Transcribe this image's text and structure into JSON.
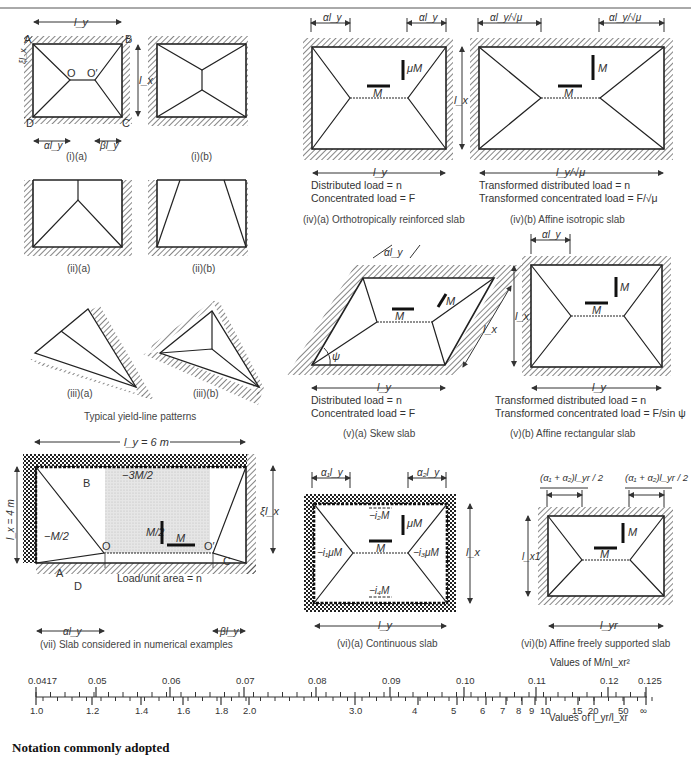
{
  "figure": {
    "panels": {
      "i_a": {
        "caption": "(i)(a)",
        "labels": {
          "ly": "l_y",
          "lx": "l_x",
          "xi_lx": "ξl_x",
          "alpha_ly": "αl_y",
          "beta_ly": "βl_y",
          "A": "A",
          "B": "B",
          "C": "C",
          "D": "D",
          "O": "O",
          "O_prime": "O′"
        }
      },
      "i_b": {
        "caption": "(i)(b)"
      },
      "ii_a": {
        "caption": "(ii)(a)"
      },
      "ii_b": {
        "caption": "(ii)(b)"
      },
      "iii_a": {
        "caption": "(iii)(a)"
      },
      "iii_b": {
        "caption": "(iii)(b)"
      },
      "group_caption": "Typical yield-line patterns",
      "iv_a": {
        "caption": "(iv)(a) Orthotropically reinforced slab",
        "dim_top": "αl_y",
        "dim_bottom": "l_y",
        "dim_side": "l_x",
        "moment_v": "μM",
        "moment_h": "M",
        "load1": "Distributed load = n",
        "load2": "Concentrated load = F"
      },
      "iv_b": {
        "caption": "(iv)(b) Affine isotropic slab",
        "dim_top": "αl_y/√μ",
        "dim_bottom": "l_y/√μ",
        "moment_v": "M",
        "moment_h": "M",
        "load1": "Transformed distributed load = n",
        "load2": "Transformed concentrated load = F/√μ"
      },
      "v_a": {
        "caption": "(v)(a) Skew slab",
        "dim_top": "αl_y",
        "dim_bottom": "l_y",
        "dim_side": "l_x",
        "angle": "ψ",
        "moment_v": "M",
        "moment_h": "M",
        "load1": "Distributed load = n",
        "load2": "Concentrated load = F"
      },
      "v_b": {
        "caption": "(v)(b) Affine rectangular slab",
        "dim_top": "αl_y",
        "dim_bottom": "l_y",
        "dim_side": "l_x",
        "moment_v": "M",
        "moment_h": "M",
        "load1": "Transformed distributed load = n",
        "load2": "Transformed concentrated load = F/sin ψ"
      },
      "vii": {
        "caption": "(vii) Slab considered in numerical examples",
        "dim_top": "l_y = 6 m",
        "dim_side": "l_x = 4 m",
        "dim_right": "ξl_x",
        "alpha_ly": "αl_y",
        "beta_ly": "βl_y",
        "neg_moment_top": "−3M/2",
        "neg_moment_left": "−M/2",
        "pos_moment_v": "M/2",
        "pos_moment_h": "M",
        "load": "Load/unit area = n",
        "labels": {
          "A": "A",
          "B": "B",
          "C": "C",
          "D": "D",
          "O": "O",
          "O_prime": "O′"
        }
      },
      "vi_a": {
        "caption": "(vi)(a) Continuous slab",
        "dim_top_left": "α₁l_y",
        "dim_top_right": "α₂l_y",
        "dim_bottom": "l_y",
        "dim_side": "l_x",
        "m_top": "−i₂M",
        "m_bottom": "−i₄M",
        "m_left": "−i₁μM",
        "m_right": "−i₃μM",
        "moment_v": "μM",
        "moment_h": "M"
      },
      "vi_b": {
        "caption": "(vi)(b) Affine freely supported slab",
        "dim_top": "(α₁ + α₂)l_yr / 2",
        "dim_bottom": "l_yr",
        "dim_side": "l_x1",
        "moment_v": "M",
        "moment_h": "M"
      }
    },
    "footer_heading": "Notation commonly adopted"
  },
  "chart_data": {
    "type": "nomogram",
    "top_scale_label": "Values of M/nl_xr²",
    "bottom_scale_label": "Values of l_yr/l_xr",
    "top_ticks": [
      {
        "label": "0.0417",
        "x": 36
      },
      {
        "label": "0.05",
        "x": 96
      },
      {
        "label": "0.06",
        "x": 170
      },
      {
        "label": "0.07",
        "x": 244
      },
      {
        "label": "0.08",
        "x": 316
      },
      {
        "label": "0.09",
        "x": 390
      },
      {
        "label": "0.10",
        "x": 464
      },
      {
        "label": "0.11",
        "x": 536
      },
      {
        "label": "0.12",
        "x": 608
      },
      {
        "label": "0.125",
        "x": 646
      }
    ],
    "bottom_ticks": [
      {
        "label": "1.0",
        "x": 36
      },
      {
        "label": "1.2",
        "x": 92
      },
      {
        "label": "1.4",
        "x": 141
      },
      {
        "label": "1.6",
        "x": 183
      },
      {
        "label": "1.8",
        "x": 221
      },
      {
        "label": "2.0",
        "x": 249
      },
      {
        "label": "3.0",
        "x": 355
      },
      {
        "label": "4",
        "x": 418
      },
      {
        "label": "5",
        "x": 457
      },
      {
        "label": "6",
        "x": 486
      },
      {
        "label": "7",
        "x": 506
      },
      {
        "label": "8",
        "x": 522
      },
      {
        "label": "9",
        "x": 535
      },
      {
        "label": "10",
        "x": 546
      },
      {
        "label": "15",
        "x": 578
      },
      {
        "label": "20",
        "x": 594
      },
      {
        "label": "50",
        "x": 624
      },
      {
        "label": "∞",
        "x": 646
      }
    ]
  }
}
